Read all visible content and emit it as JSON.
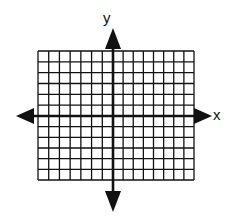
{
  "diagram": {
    "type": "coordinate-plane",
    "x_axis_label": "x",
    "y_axis_label": "y",
    "grid": {
      "columns": 15,
      "rows": 12,
      "columns_left_of_y_axis": 7,
      "columns_right_of_y_axis": 8,
      "rows_above_x_axis": 6,
      "rows_below_x_axis": 6
    },
    "arrows": [
      "up",
      "down",
      "left",
      "right"
    ],
    "colors": {
      "line": "#111111",
      "background": "#ffffff"
    }
  }
}
